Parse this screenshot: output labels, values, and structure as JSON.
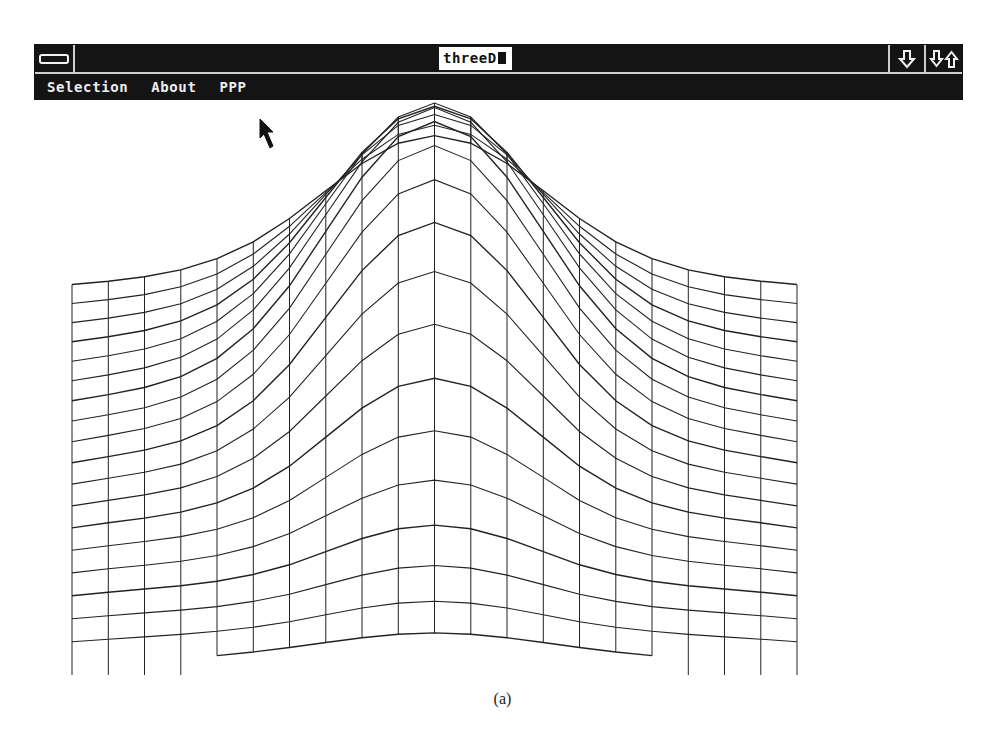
{
  "window": {
    "title": "threeD",
    "system_menu_icon": "system-menu-icon",
    "minimize_icon": "minimize-arrow-icon",
    "maximize_icon": "restore-arrows-icon",
    "bar_color": "#141414",
    "text_color": "#eeeeee"
  },
  "menu": {
    "items": [
      {
        "label": "Selection"
      },
      {
        "label": "About"
      },
      {
        "label": "PPP"
      }
    ]
  },
  "plot": {
    "type": "3d-wireframe-surface",
    "description": "Gaussian bump surface rendered as wireframe mesh",
    "line_color": "#222222",
    "columns": 21,
    "rows": 19,
    "col_x_start": 72,
    "col_x_end": 797,
    "peak_screen": {
      "x": 435,
      "y": 145
    }
  },
  "cursor": {
    "icon": "mouse-pointer-icon"
  },
  "caption": "(a)"
}
